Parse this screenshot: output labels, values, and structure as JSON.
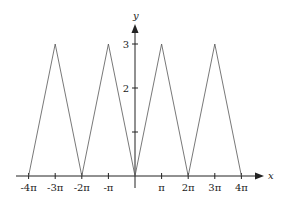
{
  "chart_data": {
    "type": "line",
    "title": "",
    "xlabel": "x",
    "ylabel": "y",
    "x_ticks": [
      "-4π",
      "-3π",
      "-2π",
      "-π",
      "π",
      "2π",
      "3π",
      "4π"
    ],
    "x_tick_values": [
      -4,
      -3,
      -2,
      -1,
      1,
      2,
      3,
      4
    ],
    "y_ticks": [
      "2",
      "3"
    ],
    "y_tick_values": [
      1,
      2,
      3
    ],
    "x_unit": "π",
    "xlim": [
      -4.2,
      4.7
    ],
    "ylim": [
      0,
      3.4
    ],
    "grid": false,
    "legend": null,
    "series": [
      {
        "name": "triangle wave",
        "x": [
          -4,
          -3,
          -2,
          -1,
          0,
          1,
          2,
          3,
          4
        ],
        "y": [
          0,
          3,
          0,
          3,
          0,
          3,
          0,
          3,
          0
        ]
      }
    ]
  }
}
